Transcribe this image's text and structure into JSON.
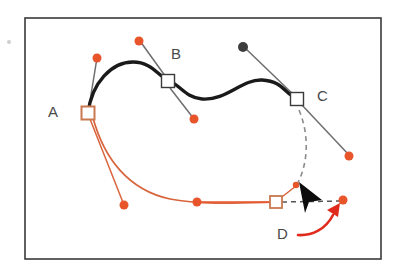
{
  "figure": {
    "background_color": "#ffffff",
    "frame": {
      "name": "illustration-frame",
      "x": 25,
      "y": 18,
      "width": 356,
      "height": 241,
      "stroke_color": "#3a3a3a",
      "stroke_width": 1.6,
      "fill": "#ffffff"
    },
    "colors": {
      "orange": "#e8552b",
      "orange_light": "#e2703f",
      "orange_handle_line": "#d9643c",
      "black": "#1a1a1a",
      "gray_handle": "#6e6e6e",
      "gray_dashed": "#8c8c8c",
      "dark_dot": "#3d3d3d",
      "label_text": "#4a4a4a",
      "red_arrow": "#e02b1c",
      "anchor_white_fill": "#ffffff",
      "anchor_orange_stroke": "#c9784f"
    }
  },
  "labels": [
    {
      "id": "label-a",
      "text": "A",
      "x": 48,
      "y": 117
    },
    {
      "id": "label-b",
      "text": "B",
      "x": 171,
      "y": 59
    },
    {
      "id": "label-c",
      "text": "C",
      "x": 317,
      "y": 101
    },
    {
      "id": "label-d",
      "text": "D",
      "x": 277,
      "y": 239
    }
  ],
  "paths": {
    "black_curve": {
      "name": "black-bezier-path",
      "d": "M 88 113 C 92 82 112 62 133 62 C 152 62 158 76 168 80 C 180 85 186 98 202 99 C 226 101 242 79 262 80 C 284 81 286 96 297 98",
      "stroke": "#1a1a1a",
      "stroke_width": 3.4
    },
    "orange_curve": {
      "name": "orange-bezier-path",
      "d": "M 93 118 C 104 158 128 190 170 199 C 200 205 240 203 276 202",
      "stroke": "#d9643c",
      "stroke_width": 1.7
    },
    "orange_curve_tail": {
      "name": "orange-path-tail-segment",
      "d": "M 197 202 L 276 202",
      "stroke": "#e8552b",
      "stroke_width": 1.6
    },
    "dashed_preview": {
      "name": "dashed-preview-curve",
      "d": "M 299 110 C 310 136 308 166 296 186",
      "stroke": "#8c8c8c",
      "stroke_width": 1.6,
      "dash": "5 4"
    },
    "dashed_handle": {
      "name": "dashed-handle-line",
      "d": "M 282 202 L 340 201",
      "stroke": "#555555",
      "stroke_width": 1.5,
      "dash": "5 4"
    },
    "red_arrow": {
      "name": "red-curved-arrow",
      "d": "M 298 235 C 312 235 326 228 334 214",
      "stroke": "#e02b1c",
      "stroke_width": 2.6,
      "head": "339 204 328 213 338 216"
    }
  },
  "handles": [
    {
      "id": "handle-a-up",
      "name": "handle-line-a-upper",
      "x1": 88,
      "y1": 113,
      "x2": 97,
      "y2": 58,
      "stroke": "#6e6e6e"
    },
    {
      "id": "handle-a-dn",
      "name": "handle-line-a-lower",
      "x1": 90,
      "y1": 119,
      "x2": 124,
      "y2": 205,
      "stroke": "#d9643c"
    },
    {
      "id": "handle-b-up",
      "name": "handle-line-b-upper",
      "x1": 168,
      "y1": 80,
      "x2": 140,
      "y2": 41,
      "stroke": "#6e6e6e"
    },
    {
      "id": "handle-b-dn",
      "name": "handle-line-b-lower",
      "x1": 170,
      "y1": 88,
      "x2": 194,
      "y2": 119,
      "stroke": "#6e6e6e"
    },
    {
      "id": "handle-c-up",
      "name": "handle-line-c-upper",
      "x1": 297,
      "y1": 98,
      "x2": 244,
      "y2": 47,
      "stroke": "#6e6e6e"
    },
    {
      "id": "handle-c-dn",
      "name": "handle-line-c-lower",
      "x1": 301,
      "y1": 104,
      "x2": 349,
      "y2": 155,
      "stroke": "#6e6e6e"
    },
    {
      "id": "handle-d-in",
      "name": "handle-line-d-incoming",
      "x1": 278,
      "y1": 200,
      "x2": 296,
      "y2": 186,
      "stroke": "#d9643c"
    }
  ],
  "anchors": [
    {
      "id": "anchor-a",
      "name": "anchor-point-a",
      "x": 88,
      "y": 113,
      "size": 13,
      "fill": "#ffffff",
      "stroke": "#c9784f",
      "stroke_width": 2
    },
    {
      "id": "anchor-b",
      "name": "anchor-point-b",
      "x": 168,
      "y": 81,
      "size": 13,
      "fill": "#ffffff",
      "stroke": "#3a3a3a",
      "stroke_width": 1.4
    },
    {
      "id": "anchor-c",
      "name": "anchor-point-c",
      "x": 297,
      "y": 99,
      "size": 13,
      "fill": "#ffffff",
      "stroke": "#3a3a3a",
      "stroke_width": 1.4
    },
    {
      "id": "anchor-d",
      "name": "anchor-point-d",
      "x": 276,
      "y": 202,
      "size": 12,
      "fill": "#ffffff",
      "stroke": "#c9784f",
      "stroke_width": 1.8
    }
  ],
  "control_dots": [
    {
      "id": "dot-a-up",
      "name": "control-dot-a-upper",
      "x": 97,
      "y": 58,
      "r": 4.5,
      "fill": "#e8552b"
    },
    {
      "id": "dot-a-dn",
      "name": "control-dot-a-lower",
      "x": 124,
      "y": 205,
      "r": 4.5,
      "fill": "#e8552b"
    },
    {
      "id": "dot-b-up",
      "name": "control-dot-b-upper",
      "x": 139,
      "y": 41,
      "r": 4.5,
      "fill": "#e8552b"
    },
    {
      "id": "dot-b-dn",
      "name": "control-dot-b-lower",
      "x": 194,
      "y": 119,
      "r": 4.5,
      "fill": "#e8552b"
    },
    {
      "id": "dot-c-up",
      "name": "control-dot-c-upper",
      "x": 243,
      "y": 47,
      "r": 5.0,
      "fill": "#3d3d3d"
    },
    {
      "id": "dot-c-dn",
      "name": "control-dot-c-lower",
      "x": 349,
      "y": 156,
      "r": 4.5,
      "fill": "#e8552b"
    },
    {
      "id": "dot-curve",
      "name": "control-dot-on-path",
      "x": 197,
      "y": 202,
      "r": 4.5,
      "fill": "#e8552b"
    },
    {
      "id": "dot-d-out",
      "name": "control-dot-d-target",
      "x": 343,
      "y": 200,
      "r": 4.5,
      "fill": "#e8552b"
    },
    {
      "id": "dot-d-in",
      "name": "control-dot-d-incoming",
      "x": 296,
      "y": 185,
      "r": 3.2,
      "fill": "#e8552b"
    },
    {
      "id": "dot-stray",
      "name": "stray-gray-dot",
      "x": 9,
      "y": 42,
      "r": 2.0,
      "fill": "#cfcfcf"
    }
  ],
  "cursor": {
    "name": "mouse-cursor-arrow",
    "points": "299 182 322 200 309 202 305 213",
    "fill": "#0d0d0d"
  }
}
